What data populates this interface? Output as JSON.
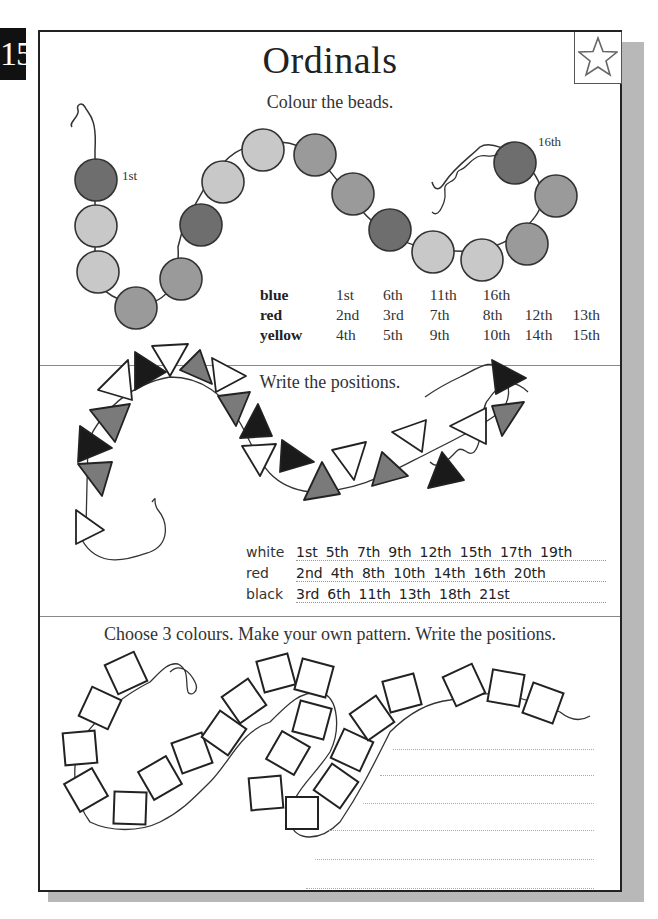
{
  "page": {
    "number": "15",
    "title": "Ordinals",
    "badge_icon": "star-icon"
  },
  "section1": {
    "instruction": "Colour the beads.",
    "bead_labels": {
      "first": "1st",
      "last": "16th"
    },
    "beads_sequence": [
      "blue",
      "red",
      "red",
      "yellow",
      "yellow",
      "blue",
      "red",
      "red",
      "yellow",
      "yellow",
      "blue",
      "red",
      "red",
      "yellow",
      "yellow",
      "blue"
    ],
    "key": [
      {
        "colour": "blue",
        "positions": [
          "1st",
          "6th",
          "11th",
          "16th"
        ]
      },
      {
        "colour": "red",
        "positions": [
          "2nd",
          "3rd",
          "7th",
          "8th",
          "12th",
          "13th"
        ]
      },
      {
        "colour": "yellow",
        "positions": [
          "4th",
          "5th",
          "9th",
          "10th",
          "14th",
          "15th"
        ]
      }
    ],
    "colors": {
      "blue": "#6e6e6e",
      "red": "#9a9a9a",
      "yellow": "#c8c8c8"
    }
  },
  "section2": {
    "instruction": "Write the positions.",
    "answers": [
      {
        "colour": "white",
        "positions": [
          "1st",
          "5th",
          "7th",
          "9th",
          "12th",
          "15th",
          "17th",
          "19th"
        ]
      },
      {
        "colour": "red",
        "positions": [
          "2nd",
          "4th",
          "8th",
          "10th",
          "14th",
          "16th",
          "20th"
        ]
      },
      {
        "colour": "black",
        "positions": [
          "3rd",
          "6th",
          "11th",
          "13th",
          "18th",
          "21st"
        ]
      }
    ],
    "colors": {
      "white": "#ffffff",
      "red": "#7a7a7a",
      "black": "#1a1a1a"
    }
  },
  "section3": {
    "instruction": "Choose 3 colours. Make your own pattern. Write the positions.",
    "write_lines": 7
  }
}
